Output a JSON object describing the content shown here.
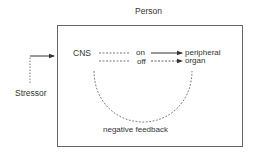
{
  "diagram": {
    "container_label": "Person",
    "input_label": "Stressor",
    "source_node": "CNS",
    "on_label": "on",
    "off_label": "off",
    "target_node_line1": "peripheral",
    "target_node_line2": "organ",
    "feedback_label": "negative feedback",
    "colors": {
      "line": "#444444",
      "box": "#555555",
      "text": "#333333"
    }
  }
}
